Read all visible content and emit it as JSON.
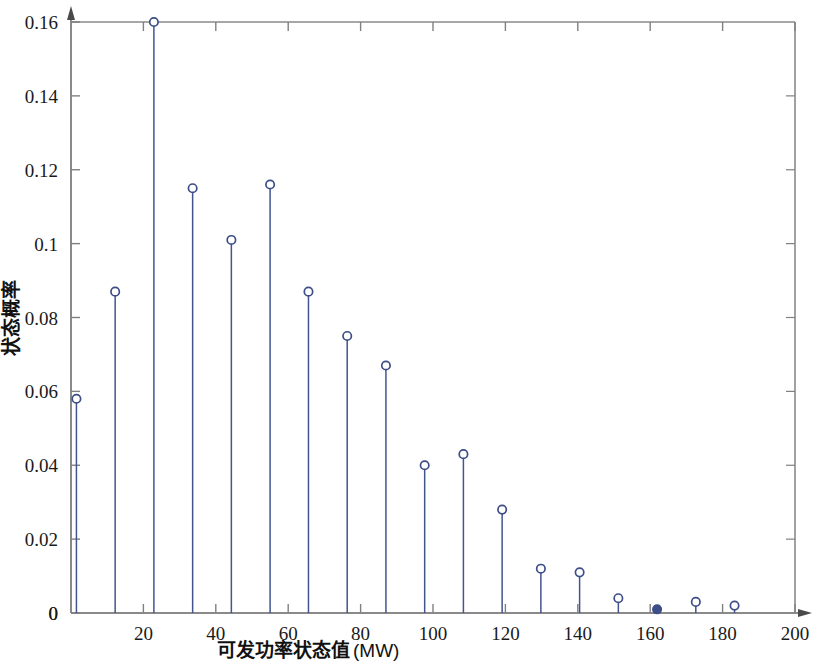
{
  "figure": {
    "background_color": "#ffffff",
    "axis_color": "#808080",
    "stem_color": "#43548f",
    "marker_face_color": "#ffffff",
    "marker_edge_color": "#3c4d87"
  },
  "chart_data": {
    "type": "line",
    "plot_style": "stem",
    "title": "",
    "xlabel": "可发功率状态值 (MW)",
    "ylabel": "状态概率",
    "xlim": [
      0,
      200
    ],
    "ylim": [
      0,
      0.16
    ],
    "grid": false,
    "legend": null,
    "xticks": [
      0,
      20,
      40,
      60,
      80,
      100,
      120,
      140,
      160,
      180,
      200
    ],
    "xtick_labels": [
      "0",
      "20",
      "40",
      "60",
      "80",
      "100",
      "120",
      "140",
      "160",
      "180",
      "200"
    ],
    "xtick_labels_shown": [
      "20",
      "40",
      "60",
      "80",
      "100",
      "120",
      "140",
      "160",
      "180",
      "200"
    ],
    "yticks": [
      0,
      0.02,
      0.04,
      0.06,
      0.08,
      0.1,
      0.12,
      0.14,
      0.16
    ],
    "ytick_labels": [
      "0",
      "0.02",
      "0.04",
      "0.06",
      "0.08",
      "0.1",
      "0.12",
      "0.14",
      "0.16"
    ],
    "x": [
      1.5,
      12.2,
      22.9,
      33.6,
      44.3,
      55.0,
      65.6,
      76.3,
      87.0,
      97.7,
      108.4,
      119.1,
      129.8,
      140.5,
      151.2,
      161.9,
      172.6,
      183.3
    ],
    "y": [
      0.058,
      0.087,
      0.16,
      0.115,
      0.101,
      0.116,
      0.087,
      0.075,
      0.067,
      0.04,
      0.043,
      0.028,
      0.012,
      0.011,
      0.004,
      0.001,
      0.003,
      0.002
    ],
    "series": [
      {
        "name": "状态概率",
        "values": [
          0.058,
          0.087,
          0.16,
          0.115,
          0.101,
          0.116,
          0.087,
          0.075,
          0.067,
          0.04,
          0.043,
          0.028,
          0.012,
          0.011,
          0.004,
          0.001,
          0.003,
          0.002
        ]
      }
    ],
    "annotations": [
      {
        "text": "peak state probability 0.16 at ~23 MW"
      }
    ]
  },
  "labels": {
    "xlabel_cn": "可发功率状态值",
    "xlabel_unit": "(MW)",
    "ylabel_cn": "状态概率"
  }
}
